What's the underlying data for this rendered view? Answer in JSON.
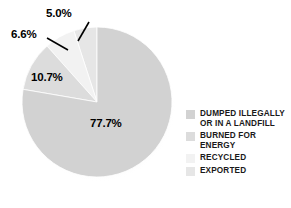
{
  "chart_data": {
    "type": "pie",
    "title": "",
    "subtitle": "",
    "xlabel": "",
    "ylabel": "",
    "grid": false,
    "legend_position": "right",
    "start_angle_deg": 0,
    "direction": "clockwise",
    "categories": [
      "DUMPED ILLEGALLY OR IN A LANDFILL",
      "BURNED FOR ENERGY",
      "RECYCLED",
      "EXPORTED"
    ],
    "values": [
      77.7,
      10.7,
      6.6,
      5.0
    ],
    "value_labels": [
      "77.7%",
      "10.7%",
      "6.6%",
      "5.0%"
    ],
    "colors": [
      "#d2d2d2",
      "#dcdcdc",
      "#f2f2f2",
      "#e6e6e6"
    ],
    "units": "percent",
    "slices": [
      {
        "name": "DUMPED ILLEGALLY OR IN A LANDFILL",
        "value": 77.7,
        "label": "77.7%",
        "color": "#d2d2d2",
        "label_placement": "inside",
        "leader_line": false
      },
      {
        "name": "BURNED FOR ENERGY",
        "value": 10.7,
        "label": "10.7%",
        "color": "#dcdcdc",
        "label_placement": "inside",
        "leader_line": false
      },
      {
        "name": "RECYCLED",
        "value": 6.6,
        "label": "6.6%",
        "color": "#f2f2f2",
        "label_placement": "outside",
        "leader_line": true
      },
      {
        "name": "EXPORTED",
        "value": 5.0,
        "label": "5.0%",
        "color": "#e6e6e6",
        "label_placement": "outside",
        "leader_line": true
      }
    ]
  },
  "labels": {
    "dumped_pct": "77.7%",
    "burned_pct": "10.7%",
    "recycled_pct": "6.6%",
    "exported_pct": "5.0%"
  },
  "legend": {
    "items": [
      {
        "label": "DUMPED ILLEGALLY OR IN A LANDFILL",
        "color": "#d2d2d2"
      },
      {
        "label": "BURNED FOR ENERGY",
        "color": "#dcdcdc"
      },
      {
        "label": "RECYCLED",
        "color": "#f2f2f2"
      },
      {
        "label": "EXPORTED",
        "color": "#e6e6e6"
      }
    ]
  },
  "style": {
    "background": "#ffffff",
    "text_color": "#000000",
    "shadow_color": "#cfcfcf"
  }
}
